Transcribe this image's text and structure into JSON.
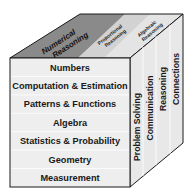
{
  "diagram": {
    "type": "cube",
    "top_face": {
      "sections": [
        {
          "label_line1": "Numerical",
          "label_line2": "Reasoning",
          "shade": "#8a8a8a"
        },
        {
          "label_line1": "Proportional",
          "label_line2": "Reasoning",
          "shade": "#d6d6d6"
        },
        {
          "label_line1": "Algebraic",
          "label_line2": "Reasoning",
          "shade": "#e6e6e6"
        }
      ]
    },
    "front_face": {
      "rows": [
        "Numbers",
        "Computation & Estimation",
        "Patterns & Functions",
        "Algebra",
        "Statistics & Probability",
        "Geometry",
        "Measurement"
      ],
      "fill": "#eeeeee"
    },
    "side_face": {
      "columns": [
        "Problem Solving",
        "Communication",
        "Reasoning",
        "Connections"
      ],
      "fill": "#e8e8e8"
    },
    "colors": {
      "edge": "#1a1a1a",
      "divider": "#ffffff",
      "top_dark": "#8a8a8a",
      "top_light": "#dcdcdc"
    }
  }
}
